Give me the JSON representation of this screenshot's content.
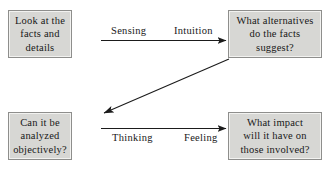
{
  "diagram": {
    "type": "flow-diagram",
    "background_color": "#ffffff",
    "box_fill_color": "#d7d7d4",
    "box_border_color": "#8e8e8c",
    "text_color": "#181818",
    "nodes": [
      {
        "id": "facts",
        "label": "Look at the\nfacts and\ndetails",
        "position": "top-left"
      },
      {
        "id": "alternatives",
        "label": "What alternatives\ndo the facts\nsuggest?",
        "position": "top-right"
      },
      {
        "id": "analyzed",
        "label": "Can it be\nanalyzed\nobjectively?",
        "position": "bottom-left"
      },
      {
        "id": "impact",
        "label": "What impact\nwill it have on\nthose involved?",
        "position": "bottom-right"
      }
    ],
    "edges": [
      {
        "id": "top-arrow",
        "from": "facts",
        "to": "alternatives",
        "direction": "right",
        "labels": [
          "Sensing",
          "Intuition"
        ],
        "label_position": "above"
      },
      {
        "id": "diagonal-arrow",
        "from": "alternatives",
        "to": "analyzed",
        "direction": "down-left",
        "labels": [],
        "label_position": "none"
      },
      {
        "id": "bottom-arrow",
        "from": "analyzed",
        "to": "impact",
        "direction": "right",
        "labels": [
          "Thinking",
          "Feeling"
        ],
        "label_position": "below"
      }
    ],
    "edge_labels": {
      "sensing": "Sensing",
      "intuition": "Intuition",
      "thinking": "Thinking",
      "feeling": "Feeling"
    }
  }
}
